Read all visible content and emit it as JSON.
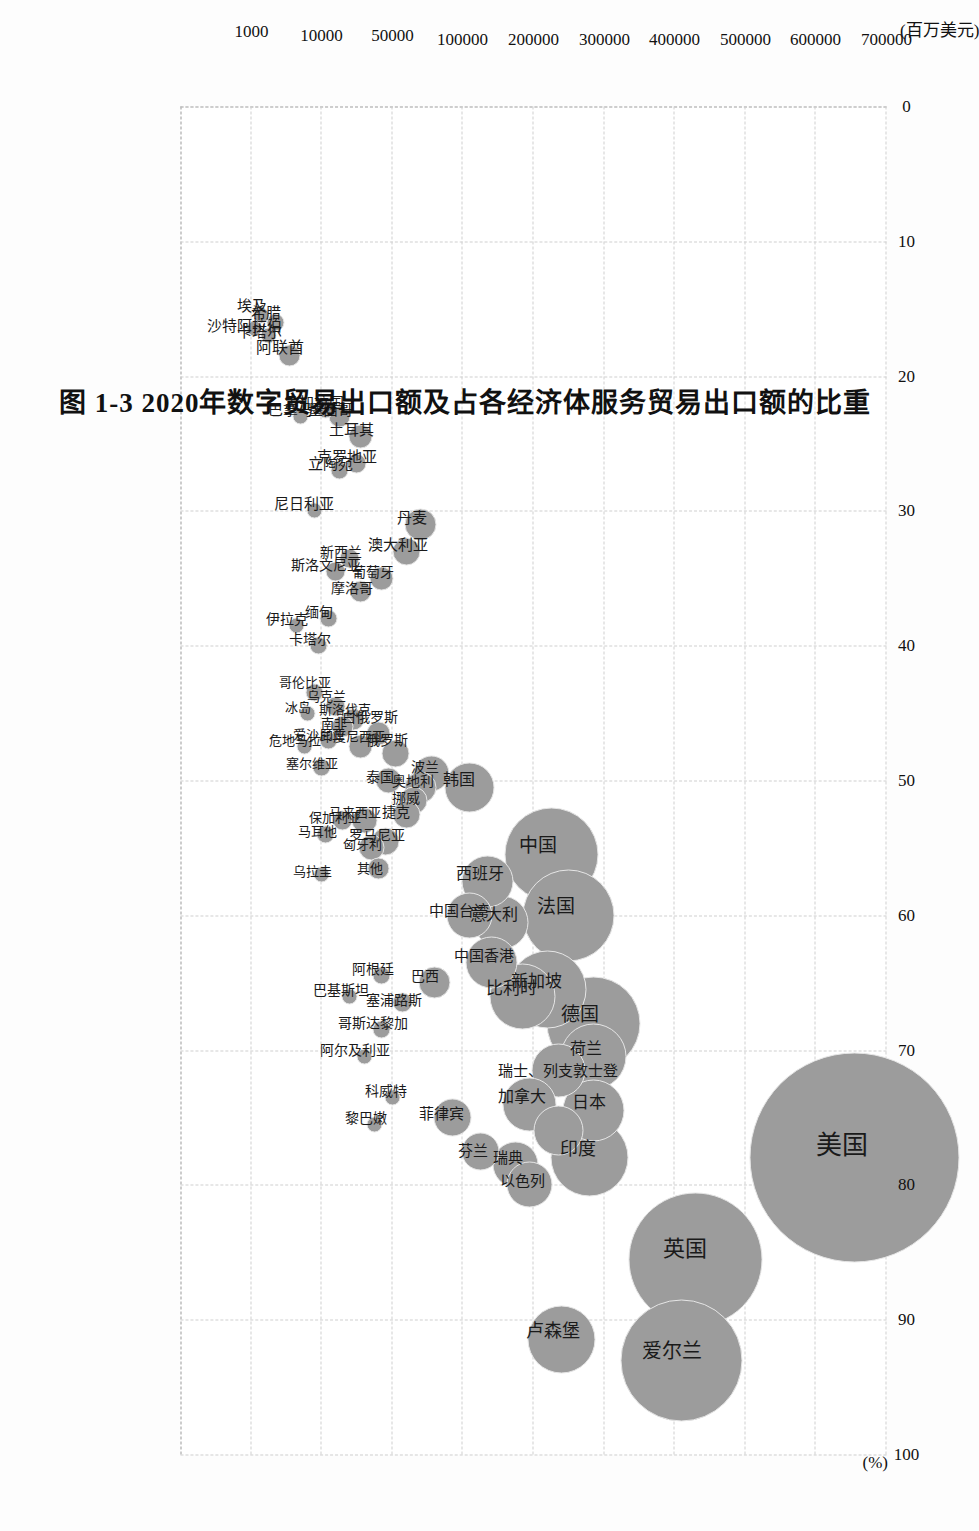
{
  "figure": {
    "caption": "图 1-3  2020年数字贸易出口额及占各经济体服务贸易出口额的比重",
    "bubble_color": "#9c9c9c",
    "grid_color": "#cfcfcf"
  },
  "chart_data": {
    "type": "scatter",
    "title": "图 1-3  2020年数字贸易出口额及占各经济体服务贸易出口额的比重",
    "xlabel": "(%)",
    "ylabel": "(百万美元)",
    "xlim": [
      0,
      100
    ],
    "ylim": [
      0,
      10
    ],
    "grid": true,
    "legend": "none",
    "xticks": [
      "0",
      "10",
      "20",
      "30",
      "40",
      "50",
      "60",
      "70",
      "80",
      "90",
      "100"
    ],
    "xtick_values": [
      0,
      10,
      20,
      30,
      40,
      50,
      60,
      70,
      80,
      90,
      100
    ],
    "yticks": [
      "1000",
      "10000",
      "50000",
      "100000",
      "200000",
      "300000",
      "400000",
      "500000",
      "600000",
      "700000"
    ],
    "ytick_values": [
      1,
      2,
      3,
      4,
      5,
      6,
      7,
      8,
      9,
      10
    ],
    "note": "y axis is a broken/non-linear scale; y position values below are axis-unit positions matching ytick_values",
    "points": [
      {
        "name": "美国",
        "x": 78.0,
        "y": 9.55,
        "r": 104,
        "size": 700000
      },
      {
        "name": "英国",
        "x": 85.5,
        "y": 7.3,
        "r": 66,
        "size": 300000
      },
      {
        "name": "爱尔兰",
        "x": 93.0,
        "y": 7.1,
        "r": 60,
        "size": 260000
      },
      {
        "name": "卢森堡",
        "x": 91.5,
        "y": 5.4,
        "r": 33,
        "size": 100000
      },
      {
        "name": "德国",
        "x": 68.0,
        "y": 5.85,
        "r": 46,
        "size": 160000
      },
      {
        "name": "中国",
        "x": 55.5,
        "y": 5.25,
        "r": 46,
        "size": 150000
      },
      {
        "name": "法国",
        "x": 60.0,
        "y": 5.5,
        "r": 45,
        "size": 150000
      },
      {
        "name": "印度",
        "x": 78.0,
        "y": 5.8,
        "r": 38,
        "size": 140000
      },
      {
        "name": "新加坡",
        "x": 65.5,
        "y": 5.2,
        "r": 38,
        "size": 120000
      },
      {
        "name": "荷兰",
        "x": 70.5,
        "y": 5.85,
        "r": 32,
        "size": 110000
      },
      {
        "name": "日本",
        "x": 74.5,
        "y": 5.85,
        "r": 30,
        "size": 100000
      },
      {
        "name": "比利时",
        "x": 66.0,
        "y": 4.85,
        "r": 32,
        "size": 95000
      },
      {
        "name": "瑞士",
        "x": 71.5,
        "y": 5.35,
        "r": 26,
        "size": 80000
      },
      {
        "name": "列支敦士登",
        "x": 76.0,
        "y": 5.35,
        "r": 24,
        "size": 75000
      },
      {
        "name": "加拿大",
        "x": 74.0,
        "y": 4.95,
        "r": 26,
        "size": 80000
      },
      {
        "name": "意大利",
        "x": 60.5,
        "y": 4.55,
        "r": 26,
        "size": 70000
      },
      {
        "name": "西班牙",
        "x": 57.5,
        "y": 4.35,
        "r": 25,
        "size": 65000
      },
      {
        "name": "中国香港",
        "x": 63.5,
        "y": 4.4,
        "r": 25,
        "size": 65000
      },
      {
        "name": "中国台湾",
        "x": 60.0,
        "y": 4.1,
        "r": 22,
        "size": 55000
      },
      {
        "name": "瑞典",
        "x": 78.5,
        "y": 4.75,
        "r": 22,
        "size": 55000
      },
      {
        "name": "以色列",
        "x": 80.0,
        "y": 4.95,
        "r": 22,
        "size": 55000
      },
      {
        "name": "韩国",
        "x": 50.5,
        "y": 4.1,
        "r": 24,
        "size": 60000
      },
      {
        "name": "芬兰",
        "x": 77.5,
        "y": 4.25,
        "r": 18,
        "size": 40000
      },
      {
        "name": "菲律宾",
        "x": 75.0,
        "y": 3.85,
        "r": 18,
        "size": 40000
      },
      {
        "name": "巴西",
        "x": 65.0,
        "y": 3.6,
        "r": 15,
        "size": 32000
      },
      {
        "name": "波兰",
        "x": 49.5,
        "y": 3.55,
        "r": 17,
        "size": 35000
      },
      {
        "name": "奥地利",
        "x": 50.5,
        "y": 3.4,
        "r": 15,
        "size": 30000
      },
      {
        "name": "挪威",
        "x": 51.5,
        "y": 3.3,
        "r": 13,
        "size": 26000
      },
      {
        "name": "捷克",
        "x": 52.5,
        "y": 3.2,
        "r": 13,
        "size": 25000
      },
      {
        "name": "俄罗斯",
        "x": 48.0,
        "y": 3.05,
        "r": 13,
        "size": 24000
      },
      {
        "name": "泰国",
        "x": 50.0,
        "y": 2.95,
        "r": 12,
        "size": 22000
      },
      {
        "name": "白俄罗斯",
        "x": 46.5,
        "y": 2.8,
        "r": 11,
        "size": 20000
      },
      {
        "name": "罗马尼亚",
        "x": 54.5,
        "y": 2.9,
        "r": 13,
        "size": 24000
      },
      {
        "name": "匈牙利",
        "x": 55.0,
        "y": 2.7,
        "r": 12,
        "size": 22000
      },
      {
        "name": "其他",
        "x": 56.5,
        "y": 2.8,
        "r": 10,
        "size": 18000
      },
      {
        "name": "马来西亚",
        "x": 53.0,
        "y": 2.6,
        "r": 12,
        "size": 21000
      },
      {
        "name": "印度尼西亚",
        "x": 47.5,
        "y": 2.55,
        "r": 11,
        "size": 19000
      },
      {
        "name": "斯洛伐克",
        "x": 45.5,
        "y": 2.45,
        "r": 10,
        "size": 17000
      },
      {
        "name": "南非",
        "x": 46.0,
        "y": 2.3,
        "r": 10,
        "size": 16000
      },
      {
        "name": "乌克兰",
        "x": 44.5,
        "y": 2.2,
        "r": 9,
        "size": 15000
      },
      {
        "name": "保加利亚",
        "x": 53.0,
        "y": 2.3,
        "r": 9,
        "size": 14000
      },
      {
        "name": "爱沙尼亚",
        "x": 47.0,
        "y": 2.1,
        "r": 8,
        "size": 12000
      },
      {
        "name": "塞尔维亚",
        "x": 49.0,
        "y": 2.0,
        "r": 8,
        "size": 12000
      },
      {
        "name": "马耳他",
        "x": 54.0,
        "y": 2.05,
        "r": 8,
        "size": 11000
      },
      {
        "name": "哥伦比亚",
        "x": 43.5,
        "y": 1.9,
        "r": 8,
        "size": 11000
      },
      {
        "name": "冰岛",
        "x": 45.0,
        "y": 1.8,
        "r": 7,
        "size": 9000
      },
      {
        "name": "危地马拉",
        "x": 47.5,
        "y": 1.75,
        "r": 7,
        "size": 9000
      },
      {
        "name": "塞浦路斯",
        "x": 66.5,
        "y": 3.15,
        "r": 9,
        "size": 14000
      },
      {
        "name": "阿根廷",
        "x": 64.5,
        "y": 2.85,
        "r": 8,
        "size": 12000
      },
      {
        "name": "哥斯达黎加",
        "x": 68.5,
        "y": 2.85,
        "r": 8,
        "size": 11000
      },
      {
        "name": "阿尔及利亚",
        "x": 70.5,
        "y": 2.6,
        "r": 7,
        "size": 9000
      },
      {
        "name": "巴基斯坦",
        "x": 66.0,
        "y": 2.4,
        "r": 7,
        "size": 9000
      },
      {
        "name": "科威特",
        "x": 73.5,
        "y": 3.0,
        "r": 7,
        "size": 9000
      },
      {
        "name": "黎巴嫩",
        "x": 75.5,
        "y": 2.75,
        "r": 7,
        "size": 9000
      },
      {
        "name": "乌拉圭",
        "x": 57.0,
        "y": 2.0,
        "r": 7,
        "size": 8000
      },
      {
        "name": "丹麦",
        "x": 31.0,
        "y": 3.4,
        "r": 15,
        "size": 30000
      },
      {
        "name": "澳大利亚",
        "x": 33.0,
        "y": 3.2,
        "r": 13,
        "size": 25000
      },
      {
        "name": "葡萄牙",
        "x": 35.0,
        "y": 2.85,
        "r": 11,
        "size": 20000
      },
      {
        "name": "摩洛哥",
        "x": 36.0,
        "y": 2.55,
        "r": 10,
        "size": 16000
      },
      {
        "name": "新西兰",
        "x": 33.5,
        "y": 2.4,
        "r": 9,
        "size": 14000
      },
      {
        "name": "斯洛文尼亚",
        "x": 34.5,
        "y": 2.2,
        "r": 9,
        "size": 13000
      },
      {
        "name": "缅甸",
        "x": 38.0,
        "y": 2.1,
        "r": 8,
        "size": 11000
      },
      {
        "name": "卡塔尔",
        "x": 40.0,
        "y": 1.95,
        "r": 8,
        "size": 11000
      },
      {
        "name": "伊拉克",
        "x": 38.5,
        "y": 1.65,
        "r": 7,
        "size": 8000
      },
      {
        "name": "土耳其",
        "x": 24.5,
        "y": 2.55,
        "r": 11,
        "size": 20000
      },
      {
        "name": "克罗地亚",
        "x": 26.5,
        "y": 2.5,
        "r": 9,
        "size": 15000
      },
      {
        "name": "墨西哥",
        "x": 23.0,
        "y": 2.25,
        "r": 10,
        "size": 16000
      },
      {
        "name": "立陶宛",
        "x": 27.0,
        "y": 2.25,
        "r": 8,
        "size": 12000
      },
      {
        "name": "孟加拉国",
        "x": 22.5,
        "y": 2.05,
        "r": 8,
        "size": 11000
      },
      {
        "name": "尼日利亚",
        "x": 30.0,
        "y": 1.9,
        "r": 7,
        "size": 9000
      },
      {
        "name": "巴拿马",
        "x": 23.0,
        "y": 1.7,
        "r": 7,
        "size": 8000
      },
      {
        "name": "阿联酋",
        "x": 18.5,
        "y": 1.55,
        "r": 10,
        "size": 16000
      },
      {
        "name": "希腊",
        "x": 16.0,
        "y": 1.35,
        "r": 8,
        "size": 11000
      },
      {
        "name": "卡塔尔2",
        "x": 17.0,
        "y": 1.25,
        "r": 7,
        "size": 9000
      },
      {
        "name": "埃及",
        "x": 15.5,
        "y": 1.15,
        "r": 7,
        "size": 9000
      },
      {
        "name": "沙特阿拉伯",
        "x": 16.5,
        "y": 1.05,
        "r": 7,
        "size": 8000
      }
    ],
    "labels": [
      {
        "text": "美国",
        "x": 78.0,
        "y": 9.55,
        "dx": 0,
        "dy": 0,
        "fs": 26
      },
      {
        "text": "英国",
        "x": 85.5,
        "y": 7.3,
        "dx": 0,
        "dy": 0,
        "fs": 22
      },
      {
        "text": "爱尔兰",
        "x": 93.0,
        "y": 7.1,
        "dx": 0,
        "dy": 0,
        "fs": 20
      },
      {
        "text": "卢森堡",
        "x": 91.5,
        "y": 5.4,
        "dx": 0,
        "dy": 0,
        "fs": 18
      },
      {
        "text": "德国",
        "x": 68.0,
        "y": 5.8,
        "dx": 0,
        "dy": 0,
        "fs": 19
      },
      {
        "text": "中国",
        "x": 55.5,
        "y": 5.2,
        "dx": 0,
        "dy": 0,
        "fs": 19
      },
      {
        "text": "法国",
        "x": 60.0,
        "y": 5.45,
        "dx": 0,
        "dy": 0,
        "fs": 19
      },
      {
        "text": "印度",
        "x": 78.0,
        "y": 5.75,
        "dx": 0,
        "dy": 0,
        "fs": 18
      },
      {
        "text": "新加坡",
        "x": 65.5,
        "y": 5.15,
        "dx": 0,
        "dy": 0,
        "fs": 17
      },
      {
        "text": "荷兰",
        "x": 70.5,
        "y": 5.85,
        "dx": 0,
        "dy": 0,
        "fs": 16
      },
      {
        "text": "日本",
        "x": 74.5,
        "y": 5.9,
        "dx": 0,
        "dy": 0,
        "fs": 17
      },
      {
        "text": "比利时",
        "x": 66.0,
        "y": 4.8,
        "dx": 0,
        "dy": 0,
        "fs": 17
      },
      {
        "text": "瑞士、列支敦士登",
        "x": 72.0,
        "y": 5.45,
        "dx": 0,
        "dy": 0,
        "fs": 15
      },
      {
        "text": "加拿大",
        "x": 74.0,
        "y": 4.95,
        "dx": 0,
        "dy": 0,
        "fs": 16
      },
      {
        "text": "意大利",
        "x": 60.5,
        "y": 4.55,
        "dx": 0,
        "dy": 0,
        "fs": 16
      },
      {
        "text": "西班牙",
        "x": 57.5,
        "y": 4.35,
        "dx": 0,
        "dy": 0,
        "fs": 16
      },
      {
        "text": "中国香港",
        "x": 63.5,
        "y": 4.4,
        "dx": 0,
        "dy": 0,
        "fs": 15
      },
      {
        "text": "中国台湾",
        "x": 60.2,
        "y": 4.05,
        "dx": 0,
        "dy": 0,
        "fs": 15
      },
      {
        "text": "瑞典",
        "x": 78.5,
        "y": 4.75,
        "dx": 0,
        "dy": 0,
        "fs": 15
      },
      {
        "text": "以色列",
        "x": 80.2,
        "y": 4.95,
        "dx": 0,
        "dy": 0,
        "fs": 15
      },
      {
        "text": "韩国",
        "x": 50.5,
        "y": 4.05,
        "dx": 0,
        "dy": 0,
        "fs": 16
      },
      {
        "text": "芬兰",
        "x": 78.0,
        "y": 4.25,
        "dx": 0,
        "dy": 0,
        "fs": 15
      },
      {
        "text": "菲律宾",
        "x": 75.2,
        "y": 3.8,
        "dx": 0,
        "dy": 0,
        "fs": 15
      },
      {
        "text": "巴西",
        "x": 65.0,
        "y": 3.55,
        "dx": 0,
        "dy": 0,
        "fs": 14
      },
      {
        "text": "波兰",
        "x": 49.5,
        "y": 3.55,
        "dx": 0,
        "dy": 0,
        "fs": 14
      },
      {
        "text": "奥地利",
        "x": 50.5,
        "y": 3.38,
        "dx": 0,
        "dy": 0,
        "fs": 14
      },
      {
        "text": "挪威",
        "x": 51.8,
        "y": 3.28,
        "dx": 0,
        "dy": 0,
        "fs": 14
      },
      {
        "text": "捷克",
        "x": 52.8,
        "y": 3.15,
        "dx": 0,
        "dy": 0,
        "fs": 14
      },
      {
        "text": "俄罗斯",
        "x": 47.5,
        "y": 3.02,
        "dx": 0,
        "dy": 0,
        "fs": 14
      },
      {
        "text": "泰国",
        "x": 50.2,
        "y": 2.92,
        "dx": 0,
        "dy": 0,
        "fs": 14
      },
      {
        "text": "白俄罗斯",
        "x": 45.8,
        "y": 2.78,
        "dx": 0,
        "dy": 0,
        "fs": 14
      },
      {
        "text": "罗马尼亚",
        "x": 54.5,
        "y": 2.88,
        "dx": 0,
        "dy": 0,
        "fs": 14
      },
      {
        "text": "匈牙利",
        "x": 55.2,
        "y": 2.66,
        "dx": 0,
        "dy": 0,
        "fs": 13
      },
      {
        "text": "其他",
        "x": 57.0,
        "y": 2.78,
        "dx": 0,
        "dy": 0,
        "fs": 13
      },
      {
        "text": "马来西亚",
        "x": 52.8,
        "y": 2.56,
        "dx": 0,
        "dy": 0,
        "fs": 13
      },
      {
        "text": "印度尼西亚",
        "x": 47.2,
        "y": 2.52,
        "dx": 0,
        "dy": 0,
        "fs": 13
      },
      {
        "text": "斯洛伐克",
        "x": 45.2,
        "y": 2.42,
        "dx": 0,
        "dy": 0,
        "fs": 13
      },
      {
        "text": "南非",
        "x": 46.2,
        "y": 2.26,
        "dx": 0,
        "dy": 0,
        "fs": 13
      },
      {
        "text": "乌克兰",
        "x": 44.2,
        "y": 2.16,
        "dx": 0,
        "dy": 0,
        "fs": 13
      },
      {
        "text": "保加利亚",
        "x": 53.2,
        "y": 2.28,
        "dx": 0,
        "dy": 0,
        "fs": 13
      },
      {
        "text": "爱沙尼亚",
        "x": 47.0,
        "y": 2.06,
        "dx": 0,
        "dy": 0,
        "fs": 13
      },
      {
        "text": "塞尔维亚",
        "x": 49.2,
        "y": 1.96,
        "dx": 0,
        "dy": 0,
        "fs": 13
      },
      {
        "text": "马耳他",
        "x": 54.2,
        "y": 2.02,
        "dx": 0,
        "dy": 0,
        "fs": 13
      },
      {
        "text": "哥伦比亚",
        "x": 43.2,
        "y": 1.86,
        "dx": 0,
        "dy": 0,
        "fs": 13
      },
      {
        "text": "冰岛",
        "x": 45.0,
        "y": 1.76,
        "dx": 0,
        "dy": 0,
        "fs": 13
      },
      {
        "text": "危地马拉",
        "x": 47.5,
        "y": 1.72,
        "dx": 0,
        "dy": 0,
        "fs": 13
      },
      {
        "text": "塞浦路斯",
        "x": 66.8,
        "y": 3.12,
        "dx": 0,
        "dy": 0,
        "fs": 14
      },
      {
        "text": "阿根廷",
        "x": 64.5,
        "y": 2.82,
        "dx": 0,
        "dy": 0,
        "fs": 14
      },
      {
        "text": "哥斯达黎加",
        "x": 68.5,
        "y": 2.82,
        "dx": 0,
        "dy": 0,
        "fs": 14
      },
      {
        "text": "阿尔及利亚",
        "x": 70.5,
        "y": 2.56,
        "dx": 0,
        "dy": 0,
        "fs": 14
      },
      {
        "text": "巴基斯坦",
        "x": 66.0,
        "y": 2.36,
        "dx": 0,
        "dy": 0,
        "fs": 14
      },
      {
        "text": "科威特",
        "x": 73.5,
        "y": 3.0,
        "dx": 0,
        "dy": 0,
        "fs": 14
      },
      {
        "text": "黎巴嫩",
        "x": 75.5,
        "y": 2.72,
        "dx": 0,
        "dy": 0,
        "fs": 14
      },
      {
        "text": "乌拉圭",
        "x": 57.2,
        "y": 1.96,
        "dx": 0,
        "dy": 0,
        "fs": 13
      },
      {
        "text": "丹麦",
        "x": 31.0,
        "y": 3.38,
        "dx": 0,
        "dy": 0,
        "fs": 15
      },
      {
        "text": "澳大利亚",
        "x": 33.0,
        "y": 3.18,
        "dx": 0,
        "dy": 0,
        "fs": 15
      },
      {
        "text": "葡萄牙",
        "x": 35.0,
        "y": 2.82,
        "dx": 0,
        "dy": 0,
        "fs": 14
      },
      {
        "text": "摩洛哥",
        "x": 36.2,
        "y": 2.52,
        "dx": 0,
        "dy": 0,
        "fs": 14
      },
      {
        "text": "新西兰",
        "x": 33.5,
        "y": 2.36,
        "dx": 0,
        "dy": 0,
        "fs": 14
      },
      {
        "text": "斯洛文尼亚",
        "x": 34.5,
        "y": 2.16,
        "dx": 0,
        "dy": 0,
        "fs": 14
      },
      {
        "text": "缅甸",
        "x": 38.0,
        "y": 2.06,
        "dx": 0,
        "dy": 0,
        "fs": 14
      },
      {
        "text": "卡塔尔",
        "x": 40.0,
        "y": 1.92,
        "dx": 0,
        "dy": 0,
        "fs": 14
      },
      {
        "text": "伊拉克",
        "x": 38.5,
        "y": 1.6,
        "dx": 0,
        "dy": 0,
        "fs": 14
      },
      {
        "text": "土耳其",
        "x": 24.5,
        "y": 2.52,
        "dx": 0,
        "dy": 0,
        "fs": 15
      },
      {
        "text": "克罗地亚",
        "x": 26.5,
        "y": 2.46,
        "dx": 0,
        "dy": 0,
        "fs": 15
      },
      {
        "text": "墨西哥",
        "x": 23.0,
        "y": 2.22,
        "dx": 0,
        "dy": 0,
        "fs": 15
      },
      {
        "text": "立陶宛",
        "x": 27.0,
        "y": 2.22,
        "dx": 0,
        "dy": 0,
        "fs": 15
      },
      {
        "text": "孟加拉国",
        "x": 22.5,
        "y": 2.0,
        "dx": 0,
        "dy": 0,
        "fs": 15
      },
      {
        "text": "尼日利亚",
        "x": 30.0,
        "y": 1.86,
        "dx": 0,
        "dy": 0,
        "fs": 15
      },
      {
        "text": "巴拿马",
        "x": 23.0,
        "y": 1.66,
        "dx": 0,
        "dy": 0,
        "fs": 15
      },
      {
        "text": "阿联酋",
        "x": 18.5,
        "y": 1.52,
        "dx": 0,
        "dy": 0,
        "fs": 16
      },
      {
        "text": "希腊",
        "x": 15.8,
        "y": 1.32,
        "dx": 0,
        "dy": 0,
        "fs": 15
      },
      {
        "text": "卡塔尔",
        "x": 17.2,
        "y": 1.22,
        "dx": 0,
        "dy": 0,
        "fs": 15
      },
      {
        "text": "埃及",
        "x": 15.3,
        "y": 1.12,
        "dx": 0,
        "dy": 0,
        "fs": 15
      },
      {
        "text": "沙特阿拉伯",
        "x": 16.8,
        "y": 1.0,
        "dx": 0,
        "dy": 0,
        "fs": 15
      }
    ]
  }
}
